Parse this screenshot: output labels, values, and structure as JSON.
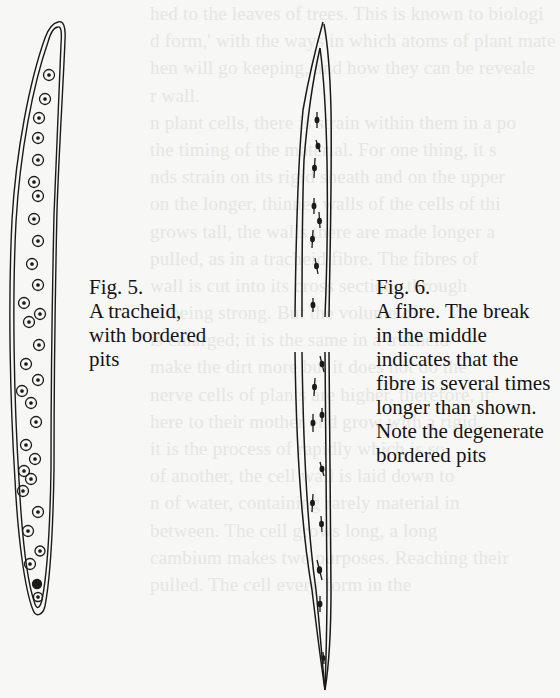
{
  "page": {
    "type": "scanned book page",
    "background_color": "#f7f7f5",
    "ink_color": "#141414"
  },
  "show_through_text": [
    "hed to the leaves of trees. This is known to biologi",
    "d form,' with the ways in which atoms of plant mate",
    "hen will go keeping, and how they can be reveale",
    "r wall.",
    "n plant cells, there is strain within them in a po",
    "the timing of the material. For one thing, it s",
    "nds strain on its rigid sheath and on the upper",
    "on the longer, thinner walls of the cells of thi",
    "grows tall, the walls there are made longer a",
    "pulled, as in a tracheid fibre. The fibres of",
    "wall is cut into its cross sections through",
    "ot being strong. But the volume of",
    "is enlarged; it is the same in a tracheid",
    "make the dirt more but it does not do the",
    "nerve cells of plants are higher, therefore, it",
    "here to their mother end grow with a rigid,",
    "it is the process of rapidly which is so",
    "of another, the cell wall is laid down to",
    "n of water, containing rarely material in",
    "between. The cell grows long, a long",
    "cambium makes two purposes. Reaching their",
    "pulled. The cell every form in the"
  ],
  "figures": [
    {
      "id": "fig5",
      "label": "Fig. 5.",
      "caption_lines": [
        "Fig. 5.",
        "A tracheid,",
        "with bordered",
        "pits"
      ],
      "drawing": "tracheid",
      "pit_icon": "bordered-pit-circle"
    },
    {
      "id": "fig6",
      "label": "Fig. 6.",
      "caption_lines": [
        "Fig. 6.",
        "A fibre. The break",
        "in the middle",
        "indicates that the",
        "fibre is several times",
        "longer than shown.",
        "Note the degenerate",
        "bordered pits"
      ],
      "drawing": "fibre",
      "pit_icon": "degenerate-pit-slit"
    }
  ]
}
